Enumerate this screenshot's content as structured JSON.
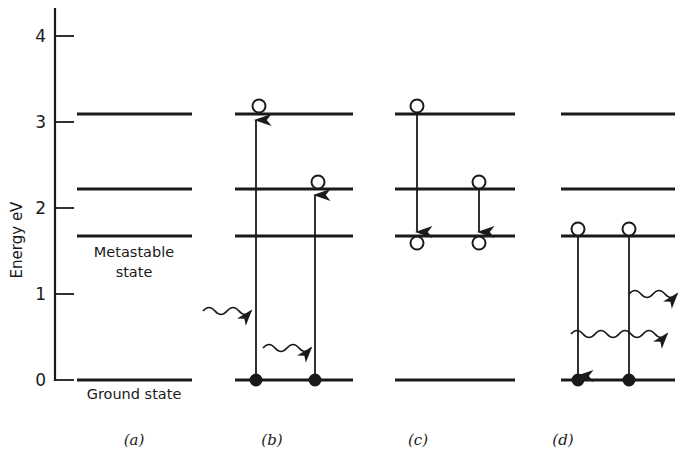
{
  "figure": {
    "axis": {
      "ylabel": "Energy eV",
      "yticks": [
        0,
        1,
        2,
        3,
        4
      ],
      "ytick_labels": [
        "0",
        "1",
        "2",
        "3",
        "4"
      ],
      "ylim": [
        0,
        4.25
      ],
      "grid": false
    },
    "annotations": {
      "ground_state": "Ground state",
      "metastable_line1": "Metastable",
      "metastable_line2": "state"
    },
    "levels": [
      {
        "name": "ground-state-level",
        "energy_ev": 0.0
      },
      {
        "name": "metastable-level",
        "energy_ev": 1.65
      },
      {
        "name": "intermediate-level",
        "energy_ev": 2.2
      },
      {
        "name": "upper-pump-level",
        "energy_ev": 3.07
      }
    ],
    "panels": [
      {
        "id": "a",
        "label": "(a)",
        "caption": "Energy levels only",
        "levels_drawn": [
          3.07,
          2.2,
          1.65,
          0.0
        ],
        "electrons": [],
        "transitions": []
      },
      {
        "id": "b",
        "label": "(b)",
        "caption": "Absorption: electrons pumped up from ground state",
        "levels_drawn": [
          3.07,
          2.2,
          1.65,
          0.0
        ],
        "electrons": [
          {
            "energy_ev": 3.07,
            "fill": "open"
          },
          {
            "energy_ev": 2.2,
            "fill": "open"
          },
          {
            "energy_ev": 0.0,
            "fill": "filled"
          },
          {
            "energy_ev": 0.0,
            "fill": "filled"
          }
        ],
        "transitions": [
          {
            "type": "straight-arrow",
            "direction": "up",
            "from_ev": 0.0,
            "to_ev": 3.07
          },
          {
            "type": "straight-arrow",
            "direction": "up",
            "from_ev": 0.0,
            "to_ev": 2.2
          },
          {
            "type": "wavy-arrow",
            "direction": "right",
            "at_ev": 0.8,
            "meaning": "incoming photon"
          },
          {
            "type": "wavy-arrow",
            "direction": "right",
            "at_ev": 0.37,
            "meaning": "incoming photon"
          }
        ]
      },
      {
        "id": "c",
        "label": "(c)",
        "caption": "Non-radiative decay down to the metastable state",
        "levels_drawn": [
          3.07,
          2.2,
          1.65,
          0.0
        ],
        "electrons": [
          {
            "energy_ev": 3.07,
            "fill": "open"
          },
          {
            "energy_ev": 2.2,
            "fill": "open"
          },
          {
            "energy_ev": 1.65,
            "fill": "open"
          },
          {
            "energy_ev": 1.65,
            "fill": "open"
          }
        ],
        "transitions": [
          {
            "type": "straight-arrow",
            "direction": "down",
            "from_ev": 3.07,
            "to_ev": 1.65
          },
          {
            "type": "straight-arrow",
            "direction": "down",
            "from_ev": 2.2,
            "to_ev": 1.65
          }
        ]
      },
      {
        "id": "d",
        "label": "(d)",
        "caption": "Stimulated emission from the metastable state to ground state",
        "levels_drawn": [
          3.07,
          2.2,
          1.65,
          0.0
        ],
        "electrons": [
          {
            "energy_ev": 1.65,
            "fill": "open"
          },
          {
            "energy_ev": 1.65,
            "fill": "open"
          },
          {
            "energy_ev": 0.0,
            "fill": "filled"
          },
          {
            "energy_ev": 0.0,
            "fill": "filled"
          }
        ],
        "transitions": [
          {
            "type": "straight-arrow",
            "direction": "down",
            "from_ev": 1.65,
            "to_ev": 0.0
          },
          {
            "type": "straight-line",
            "direction": "down",
            "from_ev": 1.65,
            "to_ev": 0.0
          },
          {
            "type": "wavy-arrow",
            "direction": "right",
            "at_ev": 1.0,
            "meaning": "emitted photon"
          },
          {
            "type": "wavy-arrow",
            "direction": "right",
            "at_ev": 0.54,
            "meaning": "emitted photon"
          }
        ]
      }
    ],
    "colors": {
      "ink": "#1a1a1a",
      "background": "#ffffff"
    }
  }
}
